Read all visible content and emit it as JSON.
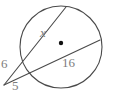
{
  "figure": {
    "stroke_color": "#4a4a4a",
    "label_color": "#7d7d7d",
    "background_color": "#ffffff",
    "center_dot_color": "#111111",
    "labels": {
      "chord_unknown": "x",
      "chord_known": "16",
      "external_upper": "6",
      "external_lower": "5"
    },
    "icons": {
      "center_point": "center-dot-icon"
    }
  },
  "chart_data": {
    "type": "diagram",
    "shapes": [
      {
        "name": "circle",
        "kind": "circle",
        "cx": 61,
        "cy": 47,
        "r": 41
      },
      {
        "name": "center-dot",
        "kind": "point",
        "cx": 61,
        "cy": 43,
        "r": 2.2
      },
      {
        "name": "secant-upper",
        "kind": "line",
        "x1": 4,
        "y1": 85,
        "x2": 66,
        "y2": 7
      },
      {
        "name": "secant-lower",
        "kind": "line",
        "x1": 4,
        "y1": 85,
        "x2": 100,
        "y2": 40
      }
    ],
    "annotations": [
      {
        "text": "x",
        "x": 45,
        "y": 33,
        "italic": true,
        "refers_to": "chord of upper secant inside circle"
      },
      {
        "text": "16",
        "x": 68,
        "y": 63,
        "italic": false,
        "refers_to": "chord of lower secant inside circle"
      },
      {
        "text": "6",
        "x": 5,
        "y": 64,
        "italic": false,
        "refers_to": "external segment of upper secant"
      },
      {
        "text": "5",
        "x": 16,
        "y": 86,
        "italic": false,
        "refers_to": "external segment of lower secant"
      }
    ],
    "xlim": [
      0,
      113
    ],
    "ylim": [
      0,
      97
    ]
  }
}
